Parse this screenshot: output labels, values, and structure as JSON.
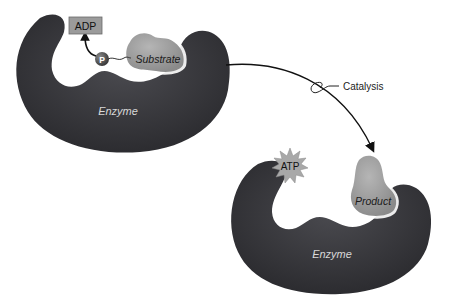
{
  "diagram": {
    "before": {
      "enzyme_label": "Enzyme",
      "substrate_label": "Substrate",
      "phosphate_label": "P",
      "adp_label": "ADP"
    },
    "transition": {
      "label": "Catalysis"
    },
    "after": {
      "enzyme_label": "Enzyme",
      "product_label": "Product",
      "atp_label": "ATP"
    },
    "colors": {
      "enzyme": "#3a3a3e",
      "substrate": "#9a9a9a",
      "adp_box": "#9b9b9b",
      "phosphate": "#5a5a5a",
      "atp_burst": "#a8a8a8",
      "arrow": "#111111",
      "background": "#ffffff"
    }
  }
}
